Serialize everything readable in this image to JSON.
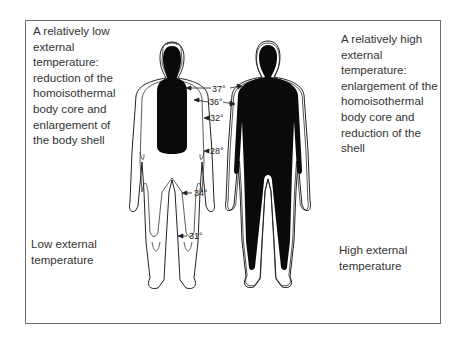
{
  "captions": {
    "top_left": {
      "lines": [
        "A relatively low",
        "external",
        "temperature:",
        "reduction of the",
        "homoisothermal",
        "body core and",
        "enlargement of",
        "the body shell"
      ]
    },
    "top_right": {
      "lines": [
        "A relatively high",
        "external",
        "temperature:",
        "enlargement of the",
        "homoisothermal",
        "body core and",
        "reduction of the",
        "shell"
      ]
    },
    "bottom_left": {
      "lines": [
        "Low external",
        "temperature"
      ]
    },
    "bottom_right": {
      "lines": [
        "High external",
        "temperature"
      ]
    }
  },
  "figures": {
    "left": {
      "name": "low-temperature-body",
      "core": "small trunk and head only"
    },
    "right": {
      "name": "high-temperature-body",
      "core": "extends into limbs"
    }
  },
  "isotherm_labels": [
    {
      "id": "t37",
      "text": "37°"
    },
    {
      "id": "t36",
      "text": "36°"
    },
    {
      "id": "t32",
      "text": "32°"
    },
    {
      "id": "t28",
      "text": "28°"
    },
    {
      "id": "t34",
      "text": "34°"
    },
    {
      "id": "t31",
      "text": "31°"
    }
  ],
  "colors": {
    "core": "#0a0a0a",
    "outline": "#222222",
    "frame": "#6e6e6e"
  }
}
